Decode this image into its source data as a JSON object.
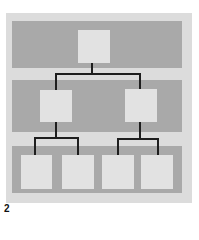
{
  "figure": {
    "label": "2",
    "type": "hierarchy-tree",
    "levels": [
      {
        "name": "level-1",
        "node_count": 1
      },
      {
        "name": "level-2",
        "node_count": 2
      },
      {
        "name": "level-3",
        "node_count": 4
      }
    ],
    "colors": {
      "panel": "#dcdcdc",
      "band": "#a9a9a9",
      "node": "#e2e2e2",
      "connector": "#1e1e1e"
    }
  }
}
